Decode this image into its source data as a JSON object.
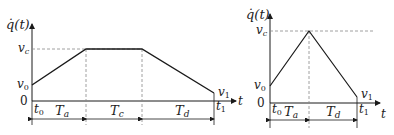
{
  "diagrams": [
    {
      "id": "trapezoidal",
      "y_label": "q̇(t)",
      "x_label": "t",
      "level_labels": {
        "vc": "v",
        "vc_sub": "c",
        "v0": "v",
        "v0_sub": "0",
        "v1": "v",
        "v1_sub": "1",
        "zero": "0"
      },
      "time_labels": {
        "t0": "t",
        "t0_sub": "0",
        "t1": "t",
        "t1_sub": "1"
      },
      "segments": [
        {
          "label": "T",
          "sub": "a"
        },
        {
          "label": "T",
          "sub": "c"
        },
        {
          "label": "T",
          "sub": "d"
        }
      ]
    },
    {
      "id": "triangular",
      "y_label": "q̇(t)",
      "x_label": "t",
      "level_labels": {
        "vc": "v",
        "vc_sub": "c",
        "v0": "v",
        "v0_sub": "0",
        "v1": "v",
        "v1_sub": "1",
        "zero": "0"
      },
      "time_labels": {
        "t0": "t",
        "t0_sub": "0",
        "t1": "t",
        "t1_sub": "1"
      },
      "segments": [
        {
          "label": "T",
          "sub": "a"
        },
        {
          "label": "T",
          "sub": "d"
        }
      ]
    }
  ],
  "colors": {
    "line": "#1a1a1a",
    "dash": "#888888"
  }
}
